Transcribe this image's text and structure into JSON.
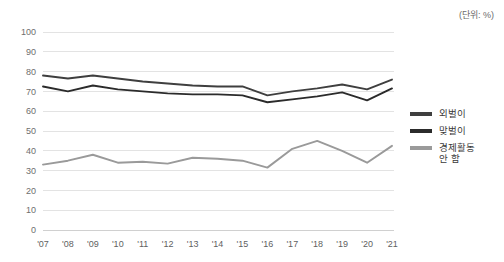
{
  "unit_note": "(단위: %)",
  "legend": {
    "position": "right",
    "items": [
      {
        "label": "외벌이",
        "color": "#3f3f3f"
      },
      {
        "label": "맞벌이",
        "color": "#2b2b2b"
      },
      {
        "label": "경제활동\n안 함",
        "color": "#9a9a9a"
      }
    ]
  },
  "axes": {
    "y_ticks": [
      "0",
      "10",
      "20",
      "30",
      "40",
      "50",
      "60",
      "70",
      "80",
      "90",
      "100"
    ],
    "x_ticks": [
      "'07",
      "'08",
      "'09",
      "'10",
      "'11",
      "'12",
      "'13",
      "'14",
      "'15",
      "'16",
      "'17",
      "'18",
      "'19",
      "'20",
      "'21"
    ]
  },
  "chart_data": {
    "type": "line",
    "title": "",
    "subtitle": "",
    "xlabel": "",
    "ylabel": "",
    "annotations": [
      "(단위: %)"
    ],
    "grid": true,
    "legend_position": "right",
    "ylim": [
      0,
      100
    ],
    "ytick_step": 10,
    "categories": [
      "'07",
      "'08",
      "'09",
      "'10",
      "'11",
      "'12",
      "'13",
      "'14",
      "'15",
      "'16",
      "'17",
      "'18",
      "'19",
      "'20",
      "'21"
    ],
    "series": [
      {
        "name": "외벌이",
        "color": "#3f3f3f",
        "values": [
          78,
          76.5,
          78,
          76.5,
          75,
          74,
          73,
          72.5,
          72.5,
          68,
          70,
          71.5,
          73.5,
          71,
          76
        ]
      },
      {
        "name": "맞벌이",
        "color": "#2b2b2b",
        "values": [
          72.5,
          70,
          73,
          71,
          70,
          69,
          68.5,
          68.5,
          68,
          64.5,
          66,
          67.5,
          69.5,
          65.5,
          71.5
        ]
      },
      {
        "name": "경제활동 안 함",
        "color": "#9a9a9a",
        "values": [
          33,
          35,
          38,
          34,
          34.5,
          33.5,
          36.5,
          36,
          35,
          31.5,
          41,
          45,
          40,
          34,
          42.5
        ]
      }
    ]
  }
}
